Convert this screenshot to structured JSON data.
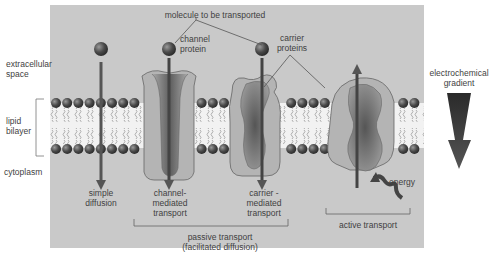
{
  "labels": {
    "molecule": "molecule to be transported",
    "channel_protein": [
      "channel",
      "protein"
    ],
    "carrier_proteins": [
      "carrier",
      "proteins"
    ],
    "extracellular": [
      "extracellular",
      "space"
    ],
    "lipid_bilayer": [
      "lipid",
      "bilayer"
    ],
    "cytoplasm": "cytoplasm",
    "electrochemical_gradient": [
      "electrochemical",
      "gradient"
    ],
    "simple_diffusion": [
      "simple",
      "diffusion"
    ],
    "channel_mediated": [
      "channel-",
      "mediated",
      "transport"
    ],
    "carrier_mediated": [
      "carrier -",
      "mediated",
      "transport"
    ],
    "energy": "energy",
    "passive_transport": [
      "passive transport",
      "(facilitated diffusion)"
    ],
    "active_transport": "active transport"
  },
  "colors": {
    "panel": "#c9c9c9",
    "bilayer_bg": "#f2f2f2",
    "head": "#4a4a4a",
    "protein": "#b4b4b4",
    "protein_core": "#6e6e6e",
    "arrow": "#555555",
    "gradient_arrow": "#3a3a3a"
  }
}
